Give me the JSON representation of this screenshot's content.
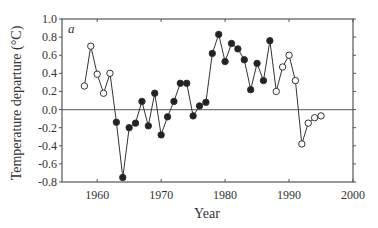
{
  "chart_data": {
    "type": "line",
    "title": "",
    "panel_label": "a",
    "xlabel": "Year",
    "ylabel": "Temperature departure (°C)",
    "xlim": [
      1954.5,
      2000
    ],
    "ylim": [
      -0.8,
      1.0
    ],
    "x_ticks": [
      1960,
      1970,
      1980,
      1990,
      2000
    ],
    "x_tick_labels": [
      "1960",
      "1970",
      "1980",
      "1990",
      "2000"
    ],
    "y_ticks": [
      1.0,
      0.8,
      0.6,
      0.4,
      0.2,
      0.0,
      -0.2,
      -0.4,
      -0.6,
      -0.8
    ],
    "y_tick_labels": [
      "1.0",
      "0.8",
      "0.6",
      "0.4",
      "0.2",
      "0.0",
      "-0.2",
      "-0.4",
      "-0.6",
      "-0.8"
    ],
    "reference_line": 0.0,
    "grid": false,
    "legend": null,
    "series": [
      {
        "name": "Temperature departure",
        "x": [
          1958,
          1959,
          1960,
          1961,
          1962,
          1963,
          1964,
          1965,
          1966,
          1967,
          1968,
          1969,
          1970,
          1971,
          1972,
          1973,
          1974,
          1975,
          1976,
          1977,
          1978,
          1979,
          1980,
          1981,
          1982,
          1983,
          1984,
          1985,
          1986,
          1987,
          1988,
          1989,
          1990,
          1991,
          1992,
          1993,
          1994,
          1995
        ],
        "values": [
          0.26,
          0.7,
          0.39,
          0.18,
          0.4,
          -0.14,
          -0.75,
          -0.2,
          -0.15,
          0.09,
          -0.18,
          0.18,
          -0.28,
          -0.08,
          0.09,
          0.29,
          0.29,
          -0.07,
          0.04,
          0.08,
          0.62,
          0.83,
          0.53,
          0.73,
          0.67,
          0.55,
          0.22,
          0.51,
          0.32,
          0.76,
          0.2,
          0.47,
          0.6,
          0.32,
          -0.38,
          -0.15,
          -0.09,
          -0.07
        ],
        "marker_filled": [
          false,
          false,
          false,
          false,
          false,
          true,
          true,
          true,
          true,
          true,
          true,
          true,
          true,
          true,
          true,
          true,
          true,
          true,
          true,
          true,
          true,
          true,
          true,
          true,
          true,
          true,
          true,
          true,
          true,
          true,
          false,
          false,
          false,
          false,
          false,
          false,
          false,
          false
        ]
      }
    ]
  },
  "colors": {
    "axis": "#555555",
    "line": "#333333",
    "marker_fill": "#222222",
    "marker_open_fill": "#ffffff",
    "zero_line": "#777777"
  }
}
